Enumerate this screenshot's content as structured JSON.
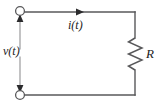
{
  "figure": {
    "type": "circuit-schematic",
    "width": 161,
    "height": 106,
    "background_color": "#ffffff",
    "line_color": "#58585a",
    "text_color": "#1b1b1b"
  },
  "labels": {
    "voltage": "v(t)",
    "current": "i(t)",
    "resistor": "R"
  },
  "elements": {
    "terminal_top": {
      "name": "top-terminal-node",
      "shape": "open-circle",
      "cx": 20,
      "cy": 11,
      "r": 4.5
    },
    "terminal_bottom": {
      "name": "bottom-terminal-node",
      "shape": "open-circle",
      "cx": 20,
      "cy": 95,
      "r": 4.5
    },
    "arrow_voltage_up": {
      "name": "voltage-arrow-up",
      "direction": "up",
      "x": 20,
      "y": 17
    },
    "arrow_voltage_down": {
      "name": "voltage-arrow-down",
      "direction": "down",
      "x": 20,
      "y": 89
    },
    "arrow_current": {
      "name": "current-direction-arrow",
      "direction": "right",
      "x": 82,
      "y": 12
    },
    "resistor": {
      "name": "resistor-zigzag",
      "x": 135,
      "y_top": 38,
      "y_bottom": 70,
      "zigzag_amplitude": 7,
      "segments": 6
    },
    "wires": {
      "top": {
        "x1": 20,
        "y1": 12,
        "x2": 135,
        "y2": 12
      },
      "right_upper": {
        "x1": 135,
        "y1": 12,
        "x2": 135,
        "y2": 38
      },
      "right_lower": {
        "x1": 135,
        "y1": 70,
        "x2": 135,
        "y2": 95
      },
      "bottom": {
        "x1": 135,
        "y1": 95,
        "x2": 20,
        "y2": 95
      },
      "left_upper": {
        "x1": 20,
        "y1": 15,
        "x2": 20,
        "y2": 50
      },
      "left_lower": {
        "x1": 20,
        "y1": 56,
        "x2": 20,
        "y2": 91
      }
    }
  }
}
